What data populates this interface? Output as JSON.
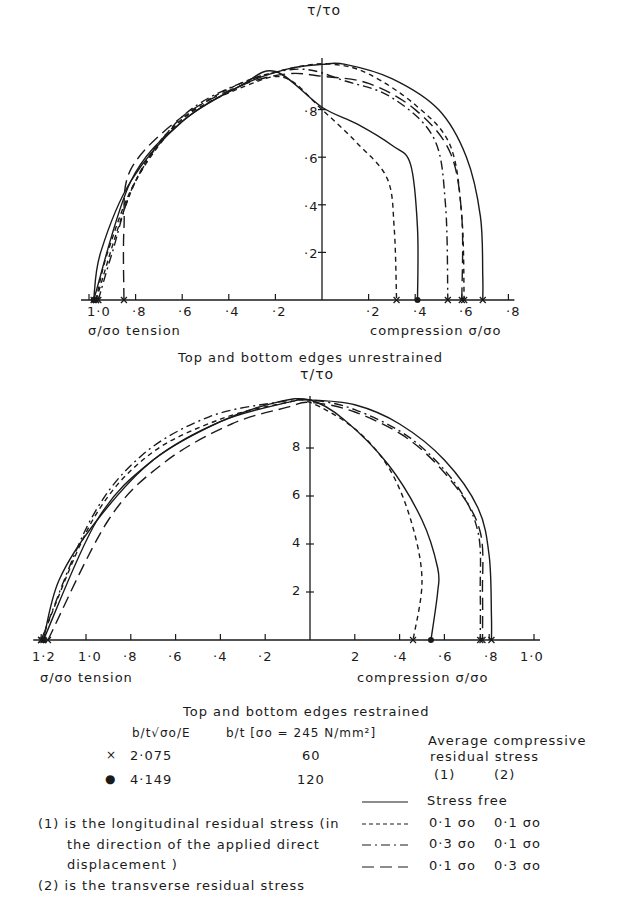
{
  "chart_data": [
    {
      "type": "line",
      "title": "Top and bottom edges unrestrained",
      "ylabel": "τ/τo",
      "xlabel_left": "σ/σo tension",
      "xlabel_right": "compression σ/σo",
      "x_ticks_left": [
        "1·0",
        "·8",
        "·6",
        "·4",
        "·2"
      ],
      "x_ticks_right": [
        "·2",
        "·4",
        "·6",
        "·8"
      ],
      "y_ticks": [
        "·2",
        "·4",
        "·6",
        "·8"
      ],
      "xlim": [
        -1.0,
        0.8
      ],
      "ylim": [
        0,
        1.0
      ],
      "grid": false,
      "note": "x negative = tension, positive = compression",
      "series": [
        {
          "name": "Stress free, b/t=60 (×)",
          "style": "solid",
          "x": [
            -0.98,
            -0.95,
            -0.82,
            -0.6,
            -0.35,
            -0.15,
            0.0,
            0.1,
            0.3,
            0.5,
            0.62,
            0.68,
            0.69,
            0.69
          ],
          "y": [
            0.0,
            0.2,
            0.5,
            0.75,
            0.9,
            0.97,
            0.99,
            0.99,
            0.93,
            0.8,
            0.6,
            0.35,
            0.1,
            0.0
          ]
        },
        {
          "name": "Stress free, b/t=120 (●)",
          "style": "solid",
          "x": [
            -0.98,
            -0.82,
            -0.6,
            -0.35,
            -0.2,
            0.0,
            0.15,
            0.3,
            0.38,
            0.41,
            0.41
          ],
          "y": [
            0.0,
            0.5,
            0.75,
            0.9,
            0.96,
            0.81,
            0.74,
            0.65,
            0.57,
            0.3,
            0.0
          ]
        },
        {
          "name": "0.1σo / 0.1σo, b/t=60",
          "style": "dashed",
          "x": [
            -0.97,
            -0.92,
            -0.8,
            -0.6,
            -0.35,
            -0.1,
            0.05,
            0.2,
            0.4,
            0.55,
            0.6,
            0.61
          ],
          "y": [
            0.0,
            0.2,
            0.5,
            0.76,
            0.91,
            0.98,
            0.99,
            0.95,
            0.82,
            0.65,
            0.35,
            0.0
          ]
        },
        {
          "name": "0.1σo / 0.1σo, b/t=120",
          "style": "dashed",
          "x": [
            -0.97,
            -0.8,
            -0.6,
            -0.3,
            -0.15,
            0.0,
            0.15,
            0.28,
            0.31,
            0.32
          ],
          "y": [
            0.0,
            0.5,
            0.76,
            0.91,
            0.93,
            0.8,
            0.66,
            0.51,
            0.3,
            0.0
          ]
        },
        {
          "name": "0.3σo / 0.1σo, b/t=60",
          "style": "dashdot",
          "x": [
            -0.96,
            -0.9,
            -0.8,
            -0.6,
            -0.35,
            -0.1,
            0.1,
            0.3,
            0.48,
            0.53,
            0.54
          ],
          "y": [
            0.0,
            0.2,
            0.5,
            0.77,
            0.91,
            0.97,
            0.92,
            0.85,
            0.68,
            0.4,
            0.0
          ]
        },
        {
          "name": "0.1σo / 0.3σo, b/t=60",
          "style": "longdash",
          "x": [
            -0.85,
            -0.85,
            -0.82,
            -0.6,
            -0.35,
            -0.15,
            0.0,
            0.2,
            0.4,
            0.55,
            0.6,
            0.6
          ],
          "y": [
            0.0,
            0.3,
            0.55,
            0.77,
            0.9,
            0.95,
            0.94,
            0.91,
            0.8,
            0.62,
            0.35,
            0.0
          ]
        }
      ]
    },
    {
      "type": "line",
      "title": "Top and bottom edges restrained",
      "ylabel": "τ/τo",
      "xlabel_left": "σ/σo tension",
      "xlabel_right": "compression σ/σo",
      "x_ticks_left": [
        "1·2",
        "1·0",
        "·8",
        "·6",
        "·4",
        "·2"
      ],
      "x_ticks_right": [
        "2",
        "·4",
        "·6",
        "·8",
        "1·0"
      ],
      "y_ticks": [
        "2",
        "4",
        "6",
        "8"
      ],
      "xlim": [
        -1.2,
        1.0
      ],
      "ylim": [
        0,
        1.0
      ],
      "grid": false,
      "series": [
        {
          "name": "Stress free, b/t=60 (×)",
          "style": "solid",
          "x": [
            -1.19,
            -1.12,
            -0.95,
            -0.7,
            -0.4,
            -0.1,
            0.0,
            0.2,
            0.4,
            0.6,
            0.75,
            0.8,
            0.81,
            0.81
          ],
          "y": [
            0.0,
            0.25,
            0.5,
            0.75,
            0.91,
            0.99,
            1.0,
            0.98,
            0.9,
            0.75,
            0.55,
            0.35,
            0.1,
            0.0
          ]
        },
        {
          "name": "Stress free, b/t=120 (●)",
          "style": "solid",
          "x": [
            -1.19,
            -0.95,
            -0.7,
            -0.4,
            -0.15,
            0.0,
            0.15,
            0.35,
            0.5,
            0.57,
            0.57,
            0.54
          ],
          "y": [
            0.0,
            0.5,
            0.75,
            0.91,
            0.99,
            1.0,
            0.92,
            0.73,
            0.5,
            0.3,
            0.2,
            0.0
          ]
        },
        {
          "name": "0.1σo / 0.1σo",
          "style": "dashed",
          "x": [
            -1.2,
            -0.97,
            -0.72,
            -0.4,
            -0.1,
            0.0,
            0.2,
            0.35,
            0.45,
            0.5,
            0.46
          ],
          "y": [
            0.0,
            0.5,
            0.77,
            0.92,
            0.99,
            0.99,
            0.88,
            0.72,
            0.5,
            0.25,
            0.0
          ]
        },
        {
          "name": "0.3σo / 0.1σo",
          "style": "dashdot",
          "x": [
            -1.2,
            -0.98,
            -0.75,
            -0.45,
            -0.15,
            0.0,
            0.2,
            0.45,
            0.65,
            0.75,
            0.76,
            0.76
          ],
          "y": [
            0.0,
            0.5,
            0.77,
            0.93,
            0.99,
            1.0,
            0.96,
            0.84,
            0.65,
            0.45,
            0.2,
            0.0
          ]
        },
        {
          "name": "0.1σo / 0.3σo",
          "style": "longdash",
          "x": [
            -1.17,
            -0.9,
            -0.65,
            -0.35,
            -0.1,
            0.0,
            0.2,
            0.45,
            0.65,
            0.76,
            0.77,
            0.77
          ],
          "y": [
            0.0,
            0.5,
            0.74,
            0.9,
            0.97,
            0.99,
            0.95,
            0.83,
            0.64,
            0.45,
            0.2,
            0.0
          ]
        }
      ]
    }
  ],
  "top_chart": {
    "y_axis_label": "τ/τo",
    "y_ticks": [
      "·2",
      "·4",
      "·6",
      "·8"
    ],
    "x_ticks_left": [
      "1·0",
      "·8",
      "·6",
      "·4",
      "·2"
    ],
    "x_ticks_right": [
      "·2",
      "·4",
      "·6",
      "·8"
    ],
    "x_label_left": "σ/σo  tension",
    "x_label_right": "compression  σ/σo",
    "caption": "Top  and  bottom  edges  unrestrained"
  },
  "bottom_chart": {
    "y_axis_label": "τ/τo",
    "y_ticks": [
      "2",
      "4",
      "6",
      "8"
    ],
    "x_ticks_left": [
      "1·2",
      "1·0",
      "·8",
      "·6",
      "·4",
      "·2"
    ],
    "x_ticks_right": [
      "2",
      "·4",
      "·6",
      "·8",
      "1·0"
    ],
    "x_label_left": "σ/σo  tension",
    "x_label_right": "compression  σ/σo",
    "caption": "Top  and  bottom  edges  restrained"
  },
  "legend": {
    "col1_header": "b/t√σo/E",
    "col2_header": "b/t [σo = 245 N/mm²]",
    "rows": [
      {
        "marker": "×",
        "slenderness": "2·075",
        "bt": "60"
      },
      {
        "marker": "●",
        "slenderness": "4·149",
        "bt": "120"
      }
    ],
    "residual_header_1": "Average compressive",
    "residual_header_2": "residual stress",
    "residual_col1": "(1)",
    "residual_col2": "(2)",
    "line_styles": [
      {
        "style": "solid",
        "c1": "Stress  free",
        "c2": ""
      },
      {
        "style": "dashed",
        "c1": "0·1 σo",
        "c2": "0·1 σo"
      },
      {
        "style": "dashdot",
        "c1": "0·3 σo",
        "c2": "0·1 σo"
      },
      {
        "style": "longdash",
        "c1": "0·1 σo",
        "c2": "0·3 σo"
      }
    ],
    "note1_a": "(1) is the longitudinal residual stress (in",
    "note1_b": "the direction of the applied direct",
    "note1_c": "displacement )",
    "note2": "(2) is the transverse residual stress"
  }
}
